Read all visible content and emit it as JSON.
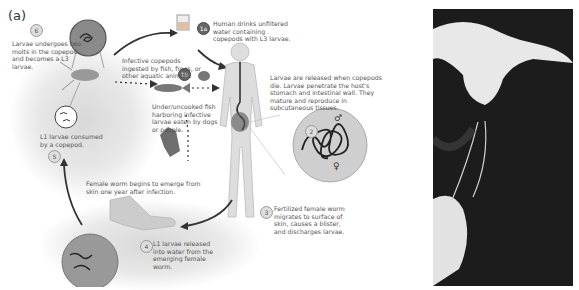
{
  "panels": {
    "a_label": "(a)",
    "b_label": "(b)"
  },
  "steps": [
    {
      "id": "6",
      "text": "Larvae undergoes two molts in the copepod and becomes a L3 larvae."
    },
    {
      "id": "1a",
      "text": "Human drinks unfiltered water containing copepods with L3 larvae."
    },
    {
      "id": "1b",
      "text": "Infective copepods ingested by fish, frogs, or other aquatic animals."
    },
    {
      "id": "1b-2",
      "text": "Under/uncooked fish harboring infective larvae eaten by dogs or people."
    },
    {
      "id": "2",
      "text": "Larvae are released when copepods die. Larvae penetrate the host's stomach and intestinal wall. They mature and reproduce in subcutaneous tissues."
    },
    {
      "id": "3",
      "text": "Fertilized female worm migrates to surface of skin, causes a blister, and discharges larvae."
    },
    {
      "id": "4",
      "text": "L1 larvae released into water from the emerging female worm."
    },
    {
      "id": "5",
      "text": "L1 larvae consumed by a copepod."
    },
    {
      "id": "emerge",
      "text": "Female worm begins to emerge from skin one year after infection."
    }
  ],
  "symbols": {
    "male": "♂",
    "female": "♀"
  },
  "badges": {
    "s6": "6",
    "s1a": "1a",
    "s1b": "1b",
    "s2": "2",
    "s3": "3",
    "s4": "4",
    "s5": "5"
  }
}
